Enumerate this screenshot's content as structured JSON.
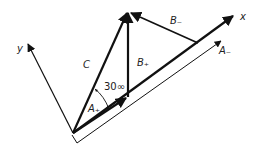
{
  "diagram": {
    "labels": {
      "x_axis": "x",
      "y_axis": "y",
      "C": "C",
      "A_plus": "A₊",
      "B_plus": "B₊",
      "B_minus": "B₋",
      "A_minus": "A₋",
      "angle": "30∞"
    },
    "colors": {
      "line": "#111111",
      "background": "#ffffff"
    }
  }
}
